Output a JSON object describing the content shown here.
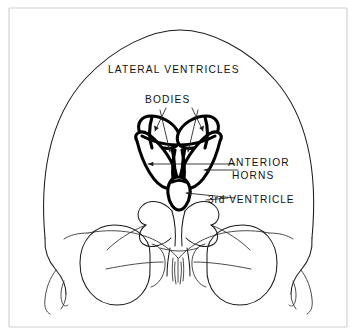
{
  "figure": {
    "style": "hand-drawn line illustration",
    "background_color": "#ffffff",
    "ink_color": "#000000",
    "frame_color": "#d2d2d2"
  },
  "labels": {
    "lateral_ventricles": "LATERAL  VENTRICLES",
    "bodies": "BODIES",
    "anterior": "ANTERIOR",
    "horns": "HORNS",
    "third_ventricle": "3rd VENTRICLE"
  },
  "structures": [
    {
      "name": "skull-outline",
      "stroke": "thin",
      "description": "cranial vault and facial outline"
    },
    {
      "name": "left-lateral-ventricle",
      "stroke": "bold",
      "description": "body and anterior horn, patient left"
    },
    {
      "name": "right-lateral-ventricle",
      "stroke": "bold",
      "description": "body and anterior horn, patient right"
    },
    {
      "name": "third-ventricle",
      "stroke": "bold",
      "description": "midline oval below the lateral ventricles"
    },
    {
      "name": "left-orbit",
      "stroke": "thin",
      "description": "eye socket, patient left"
    },
    {
      "name": "right-orbit",
      "stroke": "thin",
      "description": "eye socket, patient right"
    },
    {
      "name": "sphenoid-wings",
      "stroke": "thin",
      "description": "lesser wings of sphenoid"
    },
    {
      "name": "nasal-turbinates",
      "stroke": "thin",
      "description": "midline nasal septum and turbinates"
    },
    {
      "name": "mastoid-processes",
      "stroke": "thin",
      "description": "temporal / mastoid wisps"
    }
  ]
}
